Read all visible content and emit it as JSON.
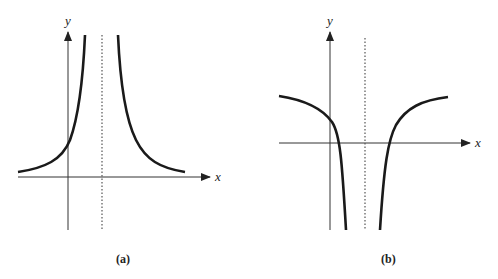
{
  "figures": [
    {
      "id": "a",
      "caption": "(a)",
      "x_label": "x",
      "y_label": "y",
      "description": "Graph with vertical asymptote (dotted) right of y-axis; both branches rise to +infinity near asymptote and approach x-axis from above"
    },
    {
      "id": "b",
      "caption": "(b)",
      "x_label": "x",
      "y_label": "y",
      "description": "Graph with vertical asymptote (dotted) right of y-axis; both branches fall to -infinity near asymptote and approach a horizontal level above x-axis"
    }
  ],
  "colors": {
    "axis": "#333333",
    "curve": "#1a1a1a",
    "asymptote": "#555555"
  }
}
